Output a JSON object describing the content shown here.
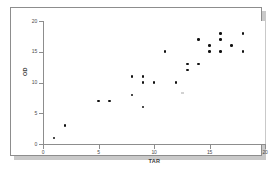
{
  "figure": {
    "background_color": "#ffffff",
    "frame_color": "#8d8d8d",
    "shadow_color": "#c9c9c9",
    "marker_color": "#111111"
  },
  "chart_data": {
    "type": "scatter",
    "title": "",
    "subtitle": "",
    "xlabel": "TAR",
    "ylabel": "OD",
    "xlim": [
      0,
      20
    ],
    "ylim": [
      0,
      20
    ],
    "xticks": [
      0,
      5,
      10,
      15,
      20
    ],
    "yticks": [
      0,
      5,
      10,
      15,
      20
    ],
    "xticklabels": [
      "0",
      "5",
      "10",
      "15",
      "20"
    ],
    "yticklabels": [
      "0",
      "5",
      "10",
      "15",
      "20"
    ],
    "grid": false,
    "legend": null,
    "legend_position": "none",
    "annotations": [],
    "series": [
      {
        "name": "OD vs TAR",
        "marker": "filled-circle",
        "color": "#111111",
        "points": [
          {
            "x": 1,
            "y": 1
          },
          {
            "x": 2,
            "y": 3
          },
          {
            "x": 5,
            "y": 7
          },
          {
            "x": 6,
            "y": 7
          },
          {
            "x": 8,
            "y": 8
          },
          {
            "x": 8,
            "y": 11
          },
          {
            "x": 9,
            "y": 6
          },
          {
            "x": 9,
            "y": 10
          },
          {
            "x": 9,
            "y": 11
          },
          {
            "x": 10,
            "y": 10
          },
          {
            "x": 11,
            "y": 15
          },
          {
            "x": 12,
            "y": 10
          },
          {
            "x": 13,
            "y": 12
          },
          {
            "x": 13,
            "y": 13
          },
          {
            "x": 14,
            "y": 13
          },
          {
            "x": 14,
            "y": 17
          },
          {
            "x": 15,
            "y": 15
          },
          {
            "x": 15,
            "y": 16
          },
          {
            "x": 16,
            "y": 15
          },
          {
            "x": 16,
            "y": 17
          },
          {
            "x": 16,
            "y": 18
          },
          {
            "x": 17,
            "y": 16
          },
          {
            "x": 18,
            "y": 15
          },
          {
            "x": 18,
            "y": 18
          }
        ]
      }
    ]
  }
}
